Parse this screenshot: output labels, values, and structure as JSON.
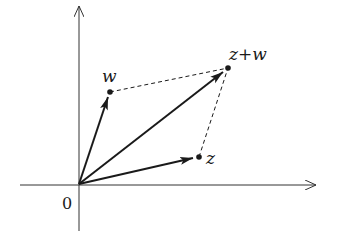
{
  "diagram": {
    "origin_label": "0",
    "points": {
      "w": {
        "label": "w"
      },
      "z": {
        "label": "z"
      },
      "z_plus_w": {
        "label": "z+w"
      }
    },
    "colors": {
      "stroke": "#1a1a1a",
      "axis": "#333333",
      "background": "#ffffff"
    }
  }
}
